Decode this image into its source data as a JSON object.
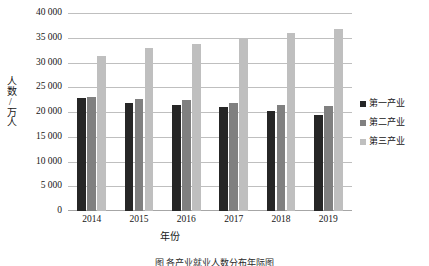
{
  "chart_data": {
    "type": "bar",
    "title": "",
    "xlabel": "年份",
    "ylabel": "人数/万人",
    "categories": [
      "2014",
      "2015",
      "2016",
      "2017",
      "2018",
      "2019"
    ],
    "series": [
      {
        "name": "第一产业",
        "color": "#262626",
        "values": [
          22790,
          21919,
          21496,
          20944,
          20258,
          19445
        ]
      },
      {
        "name": "第二产业",
        "color": "#808080",
        "values": [
          23099,
          22693,
          22350,
          21824,
          21390,
          21305
        ]
      },
      {
        "name": "第三产业",
        "color": "#bfbfbf",
        "values": [
          31364,
          32839,
          33757,
          34872,
          35938,
          36721
        ]
      }
    ],
    "ylim": [
      0,
      40000
    ],
    "ytick_values": [
      0,
      5000,
      10000,
      15000,
      20000,
      25000,
      30000,
      35000,
      40000
    ],
    "ytick_labels": [
      "0",
      "5 000",
      "10 000",
      "15 000",
      "20 000",
      "25 000",
      "30 000",
      "35 000",
      "40 000"
    ],
    "grid": true,
    "grid_axis": "y",
    "legend_position": "right"
  },
  "caption": "图   各产业就业人数分布年际图"
}
